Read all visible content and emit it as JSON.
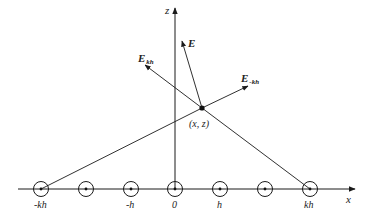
{
  "diagram": {
    "axes": {
      "x_label": "x",
      "z_label": "z"
    },
    "point_label": "(x, z)",
    "vectors": {
      "E": {
        "main": "E",
        "sub": ""
      },
      "E_kh": {
        "main": "E",
        "sub": "kh"
      },
      "E_minus_kh": {
        "main": "E",
        "sub": "-kh"
      }
    },
    "tick_labels": {
      "neg_kh": "-kh",
      "neg_h": "-h",
      "zero": "0",
      "h": "h",
      "kh": "kh"
    },
    "conductor_count": 7,
    "colors": {
      "line": "#1a1a1a",
      "text": "#222222",
      "background": "#ffffff"
    }
  }
}
